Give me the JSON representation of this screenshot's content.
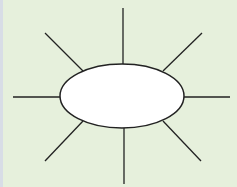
{
  "diagram": {
    "type": "spider-map",
    "background": "#e6f0dc",
    "stroke": "#222222",
    "center_node": {
      "label": "",
      "fill": "#ffffff",
      "cx": 122,
      "cy": 96,
      "rx": 62,
      "ry": 32
    },
    "spokes": [
      {
        "name": "top",
        "x1": 123,
        "y1": 8,
        "x2": 123,
        "y2": 64
      },
      {
        "name": "top-right",
        "x1": 202,
        "y1": 33,
        "x2": 163,
        "y2": 71
      },
      {
        "name": "right",
        "x1": 184,
        "y1": 97,
        "x2": 230,
        "y2": 97
      },
      {
        "name": "bottom-right",
        "x1": 163,
        "y1": 121,
        "x2": 201,
        "y2": 161
      },
      {
        "name": "bottom",
        "x1": 124,
        "y1": 128,
        "x2": 124,
        "y2": 184
      },
      {
        "name": "bottom-left",
        "x1": 83,
        "y1": 121,
        "x2": 45,
        "y2": 161
      },
      {
        "name": "left",
        "x1": 13,
        "y1": 97,
        "x2": 60,
        "y2": 97
      },
      {
        "name": "top-left",
        "x1": 45,
        "y1": 33,
        "x2": 83,
        "y2": 71
      }
    ]
  }
}
